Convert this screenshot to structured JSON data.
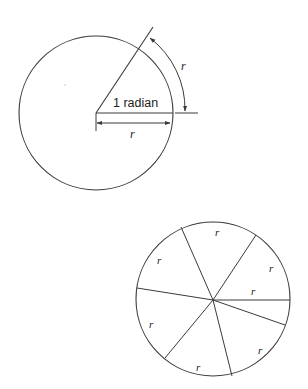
{
  "figure": {
    "top_circle": {
      "angle_label": "1 radian",
      "arc_label": "r",
      "radius_label": "r"
    },
    "bottom_circle": {
      "segment_labels": [
        "r",
        "r",
        "r",
        "r",
        "r",
        "r",
        "r"
      ]
    }
  },
  "colors": {
    "stroke": "#3a3a3a",
    "background": "#ffffff"
  }
}
